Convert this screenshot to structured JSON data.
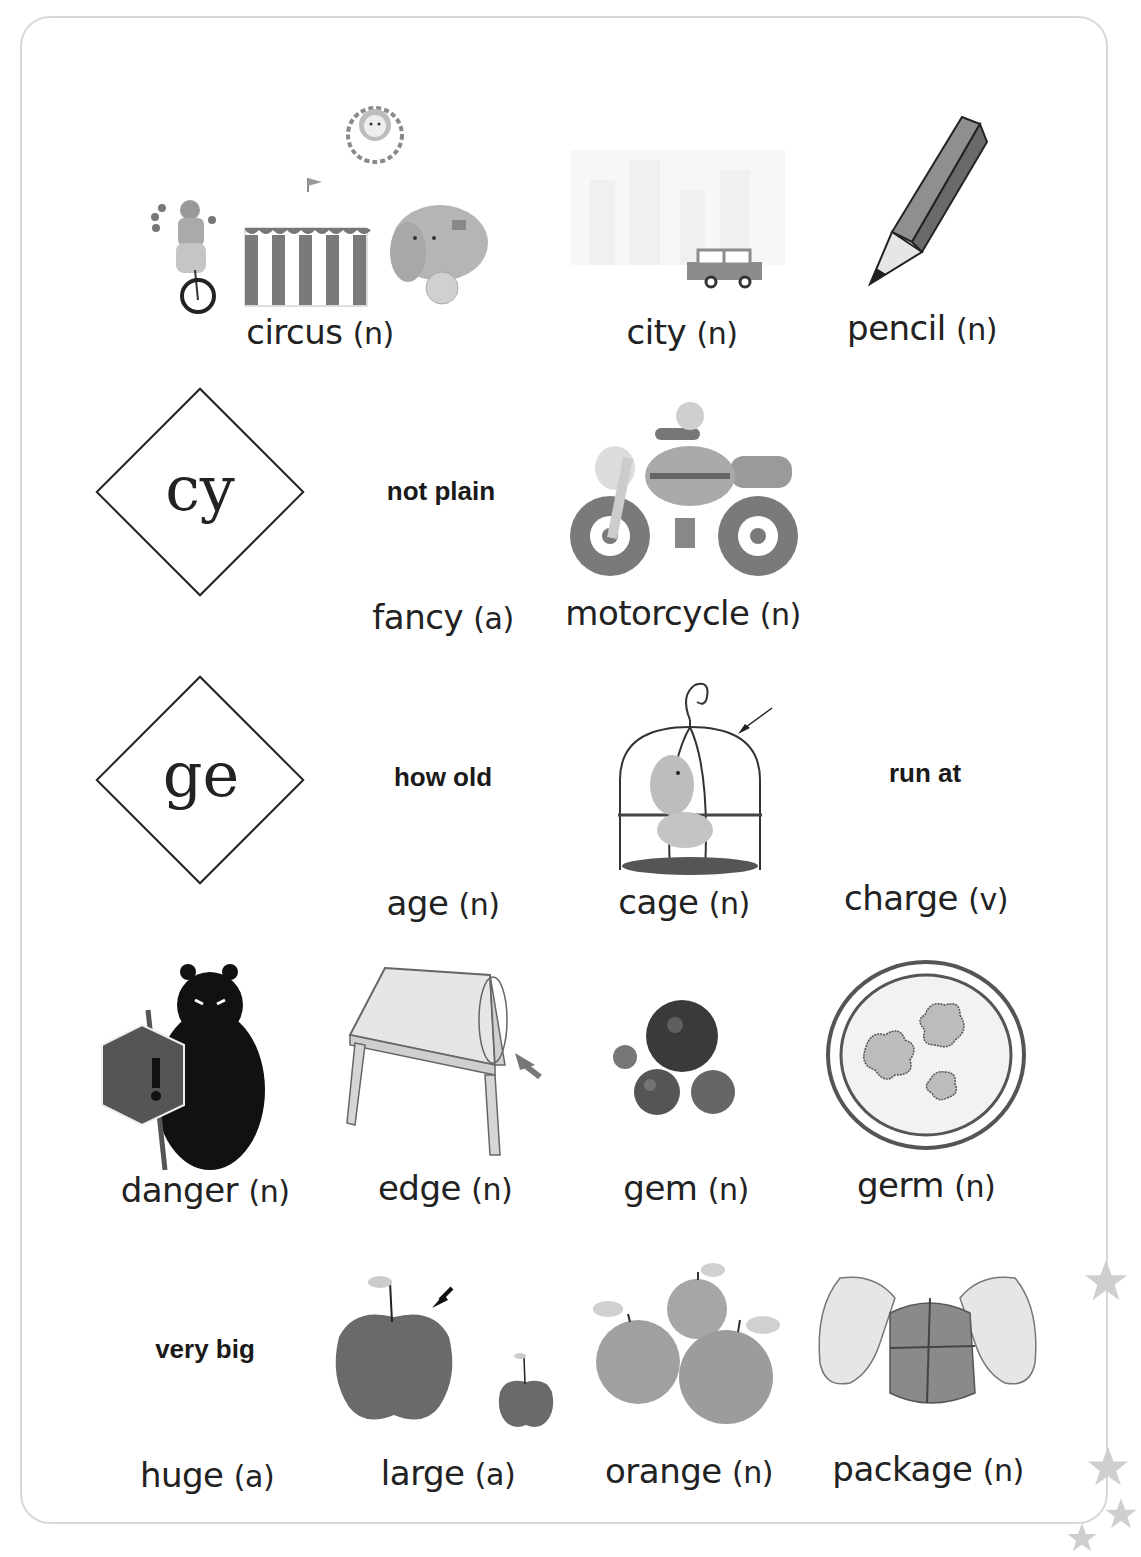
{
  "page": {
    "frame_color": "#d8d8d8",
    "star_color": "#cfcfcf"
  },
  "phonics": [
    {
      "pattern": "cy"
    },
    {
      "pattern": "ge"
    }
  ],
  "rows": [
    {
      "items": [
        {
          "word": "circus",
          "pos": "(n)",
          "icon": "circus-illustration"
        },
        {
          "word": "city",
          "pos": "(n)",
          "icon": "city-car-illustration"
        },
        {
          "word": "pencil",
          "pos": "(n)",
          "icon": "pencil-illustration"
        }
      ]
    },
    {
      "items": [
        {
          "word": "fancy",
          "pos": "(a)",
          "hint": "not plain"
        },
        {
          "word": "motorcycle",
          "pos": "(n)",
          "icon": "motorcycle-illustration"
        }
      ]
    },
    {
      "items": [
        {
          "word": "age",
          "pos": "(n)",
          "hint": "how old"
        },
        {
          "word": "cage",
          "pos": "(n)",
          "icon": "birdcage-illustration"
        },
        {
          "word": "charge",
          "pos": "(v)",
          "hint": "run at"
        }
      ]
    },
    {
      "items": [
        {
          "word": "danger",
          "pos": "(n)",
          "icon": "bear-warning-sign-illustration"
        },
        {
          "word": "edge",
          "pos": "(n)",
          "icon": "table-edge-illustration"
        },
        {
          "word": "gem",
          "pos": "(n)",
          "icon": "gems-illustration"
        },
        {
          "word": "germ",
          "pos": "(n)",
          "icon": "petri-dish-germs-illustration"
        }
      ]
    },
    {
      "items": [
        {
          "word": "huge",
          "pos": "(a)",
          "hint": "very big"
        },
        {
          "word": "large",
          "pos": "(a)",
          "icon": "apples-illustration"
        },
        {
          "word": "orange",
          "pos": "(n)",
          "icon": "oranges-illustration"
        },
        {
          "word": "package",
          "pos": "(n)",
          "icon": "hands-wrapping-package-illustration"
        }
      ]
    }
  ]
}
